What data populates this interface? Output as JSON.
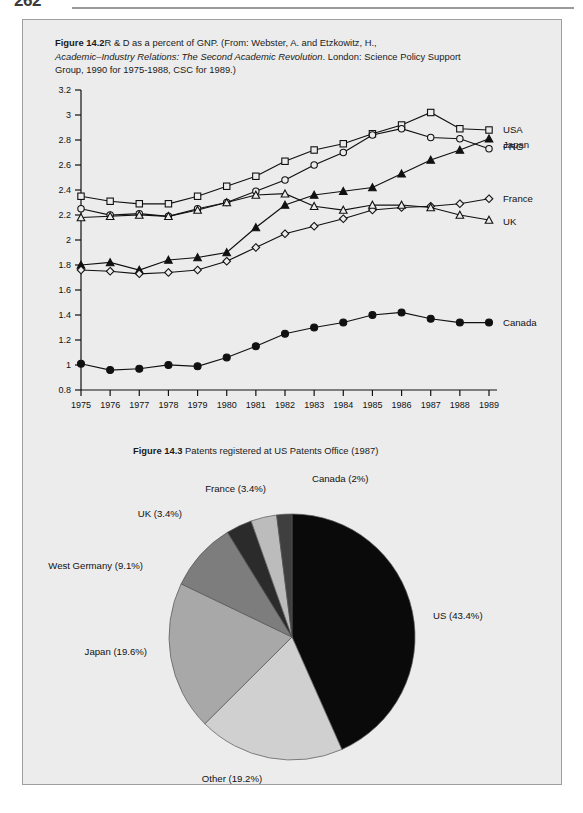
{
  "page": {
    "folio": "262",
    "panel_background": "#ececec",
    "panel_border": "#9e9e9e"
  },
  "figure_142": {
    "label": "Figure 14.2",
    "caption_line1": "R & D as a percent of GNP. (From: Webster, A. and Etzkowitz, H.,",
    "caption_italic": "Academic–Industry Relations: The Second Academic Revolution",
    "caption_line2_tail": ". London: Science Policy Support",
    "caption_line3": "Group, 1990 for 1975-1988, CSC for 1989.)"
  },
  "figure_143": {
    "label": "Figure 14.3",
    "caption": "Patents registered at US Patents Office (1987)"
  },
  "chart_data": [
    {
      "type": "line",
      "title": "R & D as a percent of GNP",
      "xlabel": "",
      "ylabel": "",
      "x": [
        1975,
        1976,
        1977,
        1978,
        1979,
        1980,
        1981,
        1982,
        1983,
        1984,
        1985,
        1986,
        1987,
        1988,
        1989
      ],
      "xticklabels": [
        "1975",
        "1976",
        "1977",
        "1978",
        "1979",
        "1980",
        "1981",
        "1982",
        "1983",
        "1984",
        "1985",
        "1986",
        "1987",
        "1988",
        "1989"
      ],
      "yticklabels": [
        "0.8",
        "1",
        "1.2",
        "1.4",
        "1.6",
        "1.8",
        "2",
        "2.2",
        "2.4",
        "2.6",
        "2.8",
        "3",
        "3.2"
      ],
      "ylim": [
        0.8,
        3.2
      ],
      "ytick_step": 0.2,
      "grid": false,
      "legend_position": "right-inline",
      "series": [
        {
          "name": "USA",
          "marker": "open-square",
          "values": [
            2.35,
            2.31,
            2.29,
            2.29,
            2.35,
            2.43,
            2.51,
            2.63,
            2.72,
            2.77,
            2.85,
            2.92,
            3.02,
            2.89,
            2.88
          ]
        },
        {
          "name": "Japan",
          "marker": "open-circle",
          "values": [
            2.25,
            2.2,
            2.21,
            2.19,
            2.25,
            2.3,
            2.39,
            2.48,
            2.6,
            2.7,
            2.84,
            2.89,
            2.82,
            2.81,
            2.73
          ]
        },
        {
          "name": "FRG",
          "marker": "filled-triangle",
          "values": [
            1.8,
            1.82,
            1.76,
            1.84,
            1.86,
            1.9,
            2.1,
            2.28,
            2.36,
            2.39,
            2.42,
            2.53,
            2.64,
            2.72,
            2.81
          ]
        },
        {
          "name": "France",
          "marker": "open-diamond",
          "values": [
            1.76,
            1.75,
            1.73,
            1.74,
            1.76,
            1.83,
            1.94,
            2.05,
            2.11,
            2.17,
            2.24,
            2.26,
            2.27,
            2.29,
            2.33
          ]
        },
        {
          "name": "UK",
          "marker": "open-triangle",
          "values": [
            2.18,
            2.19,
            2.2,
            2.19,
            2.24,
            2.3,
            2.36,
            2.37,
            2.27,
            2.24,
            2.28,
            2.28,
            2.26,
            2.2,
            2.16
          ]
        },
        {
          "name": "Canada",
          "marker": "filled-circle",
          "values": [
            1.01,
            0.96,
            0.97,
            1.0,
            0.99,
            1.06,
            1.15,
            1.25,
            1.3,
            1.34,
            1.4,
            1.42,
            1.37,
            1.34,
            1.34
          ]
        }
      ]
    },
    {
      "type": "pie",
      "title": "Patents registered at US Patents Office (1987)",
      "start_angle_deg": 0,
      "direction": "clockwise",
      "categories": [
        "US",
        "Other",
        "Japan",
        "West Germany",
        "UK",
        "France",
        "Canada"
      ],
      "values": [
        43.4,
        19.2,
        19.6,
        9.1,
        3.4,
        3.4,
        2.0
      ],
      "labels": [
        "US (43.4%)",
        "Other (19.2%)",
        "Japan (19.6%)",
        "West Germany (9.1%)",
        "UK (3.4%)",
        "France (3.4%)",
        "Canada (2%)"
      ],
      "colors": [
        "#0a0a0a",
        "#d0d0d0",
        "#a8a8a8",
        "#7d7d7d",
        "#2b2b2b",
        "#bcbcbc",
        "#3f3f3f"
      ]
    }
  ]
}
